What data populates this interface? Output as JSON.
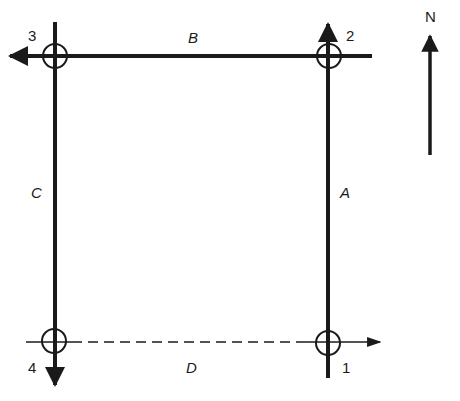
{
  "diagram": {
    "type": "traverse-layout",
    "stations": [
      {
        "id": "1",
        "label": "1",
        "x": 328,
        "y": 343
      },
      {
        "id": "2",
        "label": "2",
        "x": 329,
        "y": 56
      },
      {
        "id": "3",
        "label": "3",
        "x": 55,
        "y": 56
      },
      {
        "id": "4",
        "label": "4",
        "x": 54,
        "y": 341
      }
    ],
    "lines": [
      {
        "id": "A",
        "label": "A",
        "from": "1",
        "to": "2",
        "style": "solid",
        "direction": "north"
      },
      {
        "id": "B",
        "label": "B",
        "from": "2",
        "to": "3",
        "style": "solid",
        "direction": "west"
      },
      {
        "id": "C",
        "label": "C",
        "from": "3",
        "to": "4",
        "style": "solid",
        "direction": "south"
      },
      {
        "id": "D",
        "label": "D",
        "from": "4",
        "to": "1",
        "style": "dashed",
        "direction": "east"
      }
    ],
    "north_arrow": {
      "label": "N"
    },
    "colors": {
      "stroke": "#1a1a1a",
      "background": "#ffffff"
    }
  }
}
